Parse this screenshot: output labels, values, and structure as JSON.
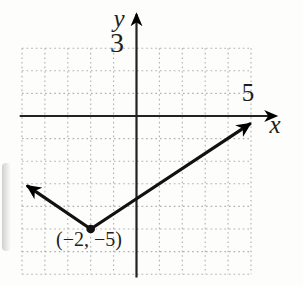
{
  "figure": {
    "colors": {
      "background": "#fdfdfb",
      "ink": "#222222",
      "curve": "#111111",
      "grid": "#b0b0b0"
    },
    "labels": {
      "y_axis": "y",
      "x_axis": "x",
      "y_tick": "3",
      "x_tick": "5",
      "vertex": "(−2, −5)"
    }
  },
  "chart_data": {
    "type": "line",
    "title": "",
    "xlabel": "x",
    "ylabel": "y",
    "grid": "dotted",
    "grid_x_range": [
      -5,
      5
    ],
    "grid_y_range": [
      -7,
      3
    ],
    "x_axis_range": [
      -5.1,
      6.1
    ],
    "y_axis_range": [
      -7.15,
      4.5
    ],
    "labeled_ticks": {
      "x": [
        5
      ],
      "y": [
        3
      ]
    },
    "vertex": [
      -2,
      -5
    ],
    "vertex_label": "(−2, −5)",
    "series": [
      {
        "name": "absolute-value-graph",
        "points": [
          [
            -4.75,
            -3.1
          ],
          [
            -2,
            -5
          ],
          [
            4.95,
            -0.35
          ]
        ],
        "arrow_ends": true
      }
    ]
  }
}
